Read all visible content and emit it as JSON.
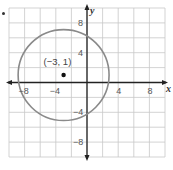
{
  "figure": {
    "bullet": "•",
    "x_axis_label": "x",
    "y_axis_label": "y",
    "x_tick_labels": [
      {
        "value": -8,
        "text": "−8"
      },
      {
        "value": -4,
        "text": "−4"
      },
      {
        "value": 4,
        "text": "4"
      },
      {
        "value": 8,
        "text": "8"
      }
    ],
    "y_tick_labels": [
      {
        "value": 8,
        "text": "8"
      },
      {
        "value": 4,
        "text": "4"
      },
      {
        "value": -4,
        "text": "−4"
      },
      {
        "value": -8,
        "text": "−8"
      }
    ],
    "point_label": "(−3, 1)",
    "center": {
      "x": -3,
      "y": 1
    },
    "radius": 5.83,
    "grid": {
      "xmin": -10,
      "xmax": 10,
      "ymin": -10,
      "ymax": 10,
      "step": 2
    },
    "colors": {
      "grid": "#c8c8c8",
      "axis": "#222222",
      "circle": "#8a8a8a",
      "point": "#111111"
    }
  }
}
